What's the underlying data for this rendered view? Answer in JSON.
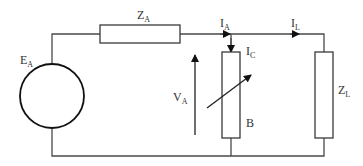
{
  "diagram": {
    "type": "electrical-circuit",
    "colors": {
      "line": "#4a4a4a",
      "background": "#ffffff"
    },
    "labels": {
      "source": {
        "main": "E",
        "sub": "A"
      },
      "series_impedance": {
        "main": "Z",
        "sub": "A"
      },
      "current_a": {
        "main": "I",
        "sub": "A"
      },
      "current_load": {
        "main": "I",
        "sub": "L"
      },
      "current_c": {
        "main": "I",
        "sub": "C"
      },
      "voltage": {
        "main": "V",
        "sub": "A"
      },
      "variable_element": "B",
      "load_impedance": {
        "main": "Z",
        "sub": "L"
      }
    },
    "components": [
      {
        "id": "EA",
        "kind": "voltage-source"
      },
      {
        "id": "ZA",
        "kind": "impedance",
        "position": "series top"
      },
      {
        "id": "B",
        "kind": "variable-impedance",
        "position": "shunt"
      },
      {
        "id": "ZL",
        "kind": "impedance",
        "position": "load"
      }
    ]
  }
}
